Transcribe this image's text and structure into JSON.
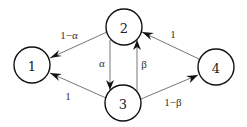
{
  "diagram": {
    "type": "state-transition-graph",
    "nodes": [
      {
        "id": "1",
        "label": "1",
        "cx": 32,
        "cy": 65,
        "r": 18
      },
      {
        "id": "2",
        "label": "2",
        "cx": 124,
        "cy": 27,
        "r": 18
      },
      {
        "id": "3",
        "label": "3",
        "cx": 123,
        "cy": 103,
        "r": 18
      },
      {
        "id": "4",
        "label": "4",
        "cx": 216,
        "cy": 67,
        "r": 18
      }
    ],
    "edges": [
      {
        "from": "2",
        "to": "1",
        "label": "1−α"
      },
      {
        "from": "2",
        "to": "3",
        "label": "α"
      },
      {
        "from": "3",
        "to": "2",
        "label": "β"
      },
      {
        "from": "3",
        "to": "1",
        "label": "1"
      },
      {
        "from": "4",
        "to": "2",
        "label": "1"
      },
      {
        "from": "3",
        "to": "4",
        "label": "1−β"
      }
    ]
  }
}
